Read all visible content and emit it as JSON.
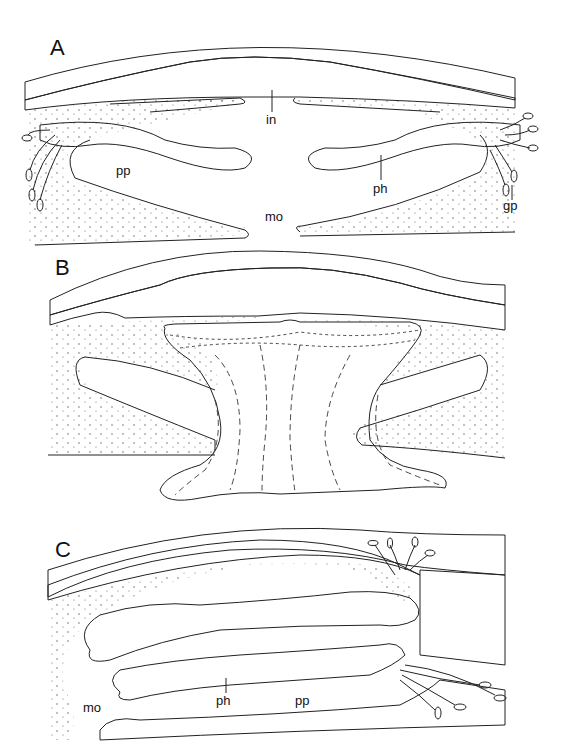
{
  "figure": {
    "panels": [
      {
        "id": "A",
        "letter": "A",
        "labels": {
          "in": "in",
          "pp_left": "pp",
          "ph": "ph",
          "gp": "gp",
          "mo": "mo"
        }
      },
      {
        "id": "B",
        "letter": "B",
        "labels": {}
      },
      {
        "id": "C",
        "letter": "C",
        "labels": {
          "mo": "mo",
          "ph": "ph",
          "pp": "pp"
        }
      }
    ]
  }
}
